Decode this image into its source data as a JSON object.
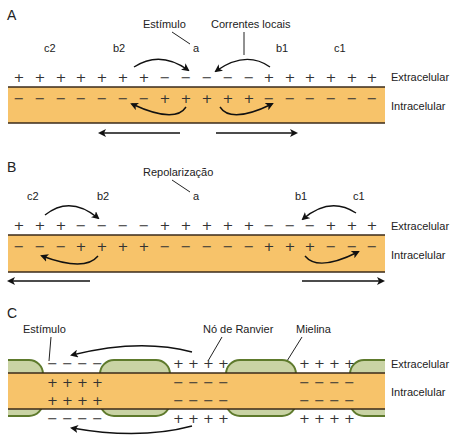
{
  "colors": {
    "axon": "#f7c36a",
    "membrane": "#3a2a1a",
    "myelin_fill": "#c9d3a4",
    "myelin_border": "#5e7a2c",
    "arrow": "#111111"
  },
  "panels": [
    {
      "id": "A",
      "letter": "A",
      "labels": {
        "stimulus": "Estímulo",
        "local_currents": "Correntes locais",
        "a": "a",
        "b1": "b1",
        "b2": "b2",
        "c1": "c1",
        "c2": "c2"
      },
      "extracellular_charges": [
        "+",
        "+",
        "+",
        "+",
        "+",
        "+",
        "+",
        "−",
        "−",
        "−",
        "−",
        "−",
        "+",
        "+",
        "+",
        "+",
        "+",
        "+"
      ],
      "intracellular_charges": [
        "−",
        "−",
        "−",
        "−",
        "−",
        "−",
        "−",
        "+",
        "+",
        "+",
        "+",
        "+",
        "−",
        "−",
        "−",
        "−",
        "−",
        "−"
      ],
      "extracellular_label": "Extracelular",
      "intracellular_label": "Intracelular"
    },
    {
      "id": "B",
      "letter": "B",
      "labels": {
        "repolarization": "Repolarização",
        "a": "a",
        "b1": "b1",
        "b2": "b2",
        "c1": "c1",
        "c2": "c2"
      },
      "extracellular_charges": [
        "+",
        "+",
        "+",
        "−",
        "−",
        "−",
        "−",
        "+",
        "+",
        "+",
        "+",
        "+",
        "−",
        "−",
        "−",
        "+",
        "+",
        "+"
      ],
      "intracellular_charges": [
        "−",
        "−",
        "−",
        "+",
        "+",
        "+",
        "+",
        "−",
        "−",
        "−",
        "−",
        "−",
        "+",
        "+",
        "+",
        "−",
        "−",
        "−"
      ],
      "extracellular_label": "Extracelular",
      "intracellular_label": "Intracelular"
    },
    {
      "id": "C",
      "letter": "C",
      "labels": {
        "stimulus": "Estímulo",
        "node": "Nó de Ranvier",
        "myelin": "Mielina"
      },
      "node1": {
        "ext_top": "− − − −",
        "int_top": "+ + + +",
        "int_bottom": "+ + + +",
        "ext_bottom": "− − − −"
      },
      "node2": {
        "ext_top": "+ + + +",
        "int_top": "− − − −",
        "int_bottom": "− − − −",
        "ext_bottom": "+ + + +"
      },
      "node3": {
        "ext_top": "+ + + +",
        "int_top": "− − − −",
        "int_bottom": "− − − −",
        "ext_bottom": "+ + + +"
      },
      "extracellular_label": "Extracelular",
      "intracellular_label": "Intracelular"
    }
  ]
}
